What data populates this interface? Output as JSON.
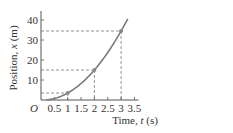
{
  "chart_data": {
    "type": "line",
    "title": "",
    "xlabel": "Time, t (s)",
    "ylabel": "Position, x (m)",
    "xlabel_parts": {
      "prefix": "Time, ",
      "var": "t",
      "unit": " (s)"
    },
    "ylabel_parts": {
      "prefix": "Position, ",
      "var": "x",
      "unit": " (m)"
    },
    "origin_label": "O",
    "xlim": [
      0,
      3.5
    ],
    "ylim": [
      0,
      45
    ],
    "x_ticks": [
      0.5,
      1,
      1.5,
      2,
      2.5,
      3,
      3.5
    ],
    "x_tick_labels": [
      "0.5",
      "1",
      "1.5",
      "2",
      "2.5",
      "3",
      "3.5"
    ],
    "y_ticks": [
      10,
      20,
      30,
      40
    ],
    "y_tick_labels": [
      "10",
      "20",
      "30",
      "40"
    ],
    "grid": false,
    "legend": null,
    "series": [
      {
        "name": "position curve",
        "x": [
          0.2,
          0.5,
          1,
          1.5,
          2,
          2.5,
          3,
          3.25
        ],
        "values": [
          0.1,
          0.75,
          3.5,
          8.25,
          15,
          23.75,
          34.5,
          40.6
        ]
      }
    ],
    "highlighted_points": [
      {
        "t": 1,
        "x": 3.5
      },
      {
        "t": 2,
        "x": 15
      },
      {
        "t": 3,
        "x": 34.5
      }
    ],
    "annotations": "dashed guide lines from highlighted points to both axes",
    "colors": {
      "curve": "#7a7a7a",
      "axis": "#555555",
      "dash": "#777777",
      "point": "#8a8a8a"
    }
  }
}
